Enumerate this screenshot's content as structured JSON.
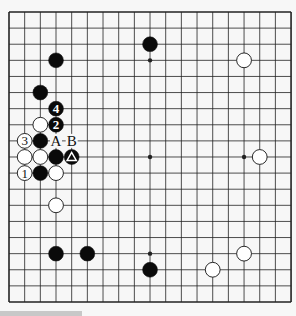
{
  "diagram": {
    "type": "go-board",
    "size": 19,
    "colors": {
      "background": "#f7f7f7",
      "grid_line": "#222222",
      "black_stone": "#0a0a0a",
      "white_stone": "#ffffff",
      "stone_outline": "#111111",
      "bottom_bar": "#c8c8c8"
    },
    "geometry": {
      "origin_x": 9,
      "origin_y": 12,
      "step_x": 15.67,
      "step_y": 16.11,
      "stone_radius": 7.4
    },
    "star_points": [
      [
        3,
        3
      ],
      [
        9,
        3
      ],
      [
        15,
        3
      ],
      [
        3,
        9
      ],
      [
        9,
        9
      ],
      [
        15,
        9
      ],
      [
        3,
        15
      ],
      [
        9,
        15
      ],
      [
        15,
        15
      ]
    ],
    "stones": [
      {
        "col": 9,
        "row": 2,
        "color": "black",
        "label": ""
      },
      {
        "col": 3,
        "row": 3,
        "color": "black",
        "label": ""
      },
      {
        "col": 15,
        "row": 3,
        "color": "white",
        "label": ""
      },
      {
        "col": 2,
        "row": 5,
        "color": "black",
        "label": ""
      },
      {
        "col": 3,
        "row": 6,
        "color": "black",
        "label": "4"
      },
      {
        "col": 2,
        "row": 7,
        "color": "white",
        "label": ""
      },
      {
        "col": 3,
        "row": 7,
        "color": "black",
        "label": "2"
      },
      {
        "col": 1,
        "row": 8,
        "color": "white",
        "label": "3"
      },
      {
        "col": 2,
        "row": 8,
        "color": "black",
        "label": ""
      },
      {
        "col": 1,
        "row": 9,
        "color": "white",
        "label": ""
      },
      {
        "col": 2,
        "row": 9,
        "color": "white",
        "label": ""
      },
      {
        "col": 3,
        "row": 9,
        "color": "black",
        "label": ""
      },
      {
        "col": 4,
        "row": 9,
        "color": "black",
        "label": "triangle"
      },
      {
        "col": 16,
        "row": 9,
        "color": "white",
        "label": ""
      },
      {
        "col": 1,
        "row": 10,
        "color": "white",
        "label": "1"
      },
      {
        "col": 2,
        "row": 10,
        "color": "black",
        "label": ""
      },
      {
        "col": 3,
        "row": 10,
        "color": "white",
        "label": ""
      },
      {
        "col": 3,
        "row": 12,
        "color": "white",
        "label": ""
      },
      {
        "col": 3,
        "row": 15,
        "color": "black",
        "label": ""
      },
      {
        "col": 5,
        "row": 15,
        "color": "black",
        "label": ""
      },
      {
        "col": 15,
        "row": 15,
        "color": "white",
        "label": ""
      },
      {
        "col": 9,
        "row": 16,
        "color": "black",
        "label": ""
      },
      {
        "col": 13,
        "row": 16,
        "color": "white",
        "label": ""
      }
    ],
    "point_labels": [
      {
        "col": 3,
        "row": 8,
        "text": "A"
      },
      {
        "col": 4,
        "row": 8,
        "text": "B"
      }
    ],
    "move_sequence": [
      {
        "move": 1,
        "color": "white",
        "col": 1,
        "row": 10
      },
      {
        "move": 2,
        "color": "black",
        "col": 3,
        "row": 7
      },
      {
        "move": 3,
        "color": "white",
        "col": 1,
        "row": 8
      },
      {
        "move": 4,
        "color": "black",
        "col": 3,
        "row": 6
      }
    ],
    "marked_stone": {
      "col": 4,
      "row": 9,
      "color": "black",
      "mark": "triangle"
    }
  }
}
